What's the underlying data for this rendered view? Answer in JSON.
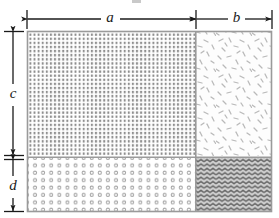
{
  "figure": {
    "type": "dimensioned-rectangle-diagram",
    "title": "",
    "background_color": "#ffffff",
    "line_color": "#1a1a1a",
    "border_color": "#9a9a9a",
    "canvas": {
      "width": 279,
      "height": 218
    }
  },
  "dimensions": {
    "horizontal": [
      {
        "id": "a",
        "label": "a",
        "orientation": "horizontal",
        "start_px": 27,
        "end_px": 194,
        "length_px": 167,
        "label_x": 110,
        "label_y": 19,
        "describes": "width of left column"
      },
      {
        "id": "b",
        "label": "b",
        "orientation": "horizontal",
        "start_px": 197,
        "end_px": 272,
        "length_px": 75,
        "label_x": 236,
        "label_y": 19,
        "describes": "width of right column"
      }
    ],
    "vertical": [
      {
        "id": "c",
        "label": "c",
        "orientation": "vertical",
        "start_px": 31,
        "end_px": 155,
        "length_px": 124,
        "label_x": 13,
        "label_y": 95,
        "describes": "height of top row"
      },
      {
        "id": "d",
        "label": "d",
        "orientation": "vertical",
        "start_px": 159,
        "end_px": 212,
        "length_px": 53,
        "label_x": 13,
        "label_y": 187,
        "describes": "height of bottom row"
      }
    ]
  },
  "rectangle": {
    "x": 27,
    "y": 31,
    "width": 245,
    "height": 181,
    "divider_x": 196,
    "divider_y": 157
  },
  "regions": [
    {
      "id": "top-left",
      "name": "region-a-c",
      "pattern": "dense-square-dot-grid",
      "pattern_color": "#8e8e8e",
      "fill_color": "#ffffff",
      "x": 28,
      "y": 32,
      "width": 167,
      "height": 124,
      "area_expression": "a x c"
    },
    {
      "id": "top-right",
      "name": "region-b-c",
      "pattern": "scattered-flakes",
      "pattern_color": "#b5b5b5",
      "fill_color": "#fdfdfd",
      "x": 197,
      "y": 32,
      "width": 74,
      "height": 124,
      "area_expression": "b x c"
    },
    {
      "id": "bottom-left",
      "name": "region-a-d",
      "pattern": "circle-dot-grid",
      "pattern_color": "#a0a0a0",
      "fill_color": "#ffffff",
      "x": 28,
      "y": 158,
      "width": 167,
      "height": 53,
      "area_expression": "a x d"
    },
    {
      "id": "bottom-right",
      "name": "region-b-d",
      "pattern": "wavy-zigzag",
      "pattern_color": "#6f6f6f",
      "fill_color": "#c9c9c9",
      "x": 197,
      "y": 158,
      "width": 74,
      "height": 53,
      "area_expression": "b x d"
    }
  ],
  "labels": {
    "a": "a",
    "b": "b",
    "c": "c",
    "d": "d"
  }
}
